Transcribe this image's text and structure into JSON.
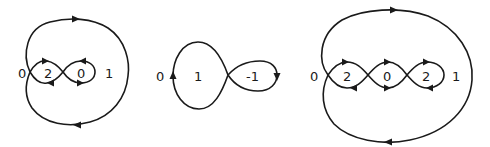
{
  "figure": {
    "diagrams": [
      {
        "id": "curve-1",
        "labels": [
          {
            "text": "0",
            "x": 18,
            "y": 78
          },
          {
            "text": "2",
            "x": 46,
            "y": 78
          },
          {
            "text": "0",
            "x": 80,
            "y": 78
          },
          {
            "text": "1",
            "x": 107,
            "y": 78
          }
        ]
      },
      {
        "id": "curve-2",
        "labels": [
          {
            "text": "0",
            "x": 158,
            "y": 80
          },
          {
            "text": "1",
            "x": 196,
            "y": 80
          },
          {
            "text": "-1",
            "x": 248,
            "y": 80
          }
        ]
      },
      {
        "id": "curve-3",
        "labels": [
          {
            "text": "0",
            "x": 310,
            "y": 81
          },
          {
            "text": "2",
            "x": 345,
            "y": 81
          },
          {
            "text": "0",
            "x": 385,
            "y": 81
          },
          {
            "text": "2",
            "x": 415,
            "y": 81
          },
          {
            "text": "1",
            "x": 453,
            "y": 81
          }
        ]
      }
    ]
  }
}
